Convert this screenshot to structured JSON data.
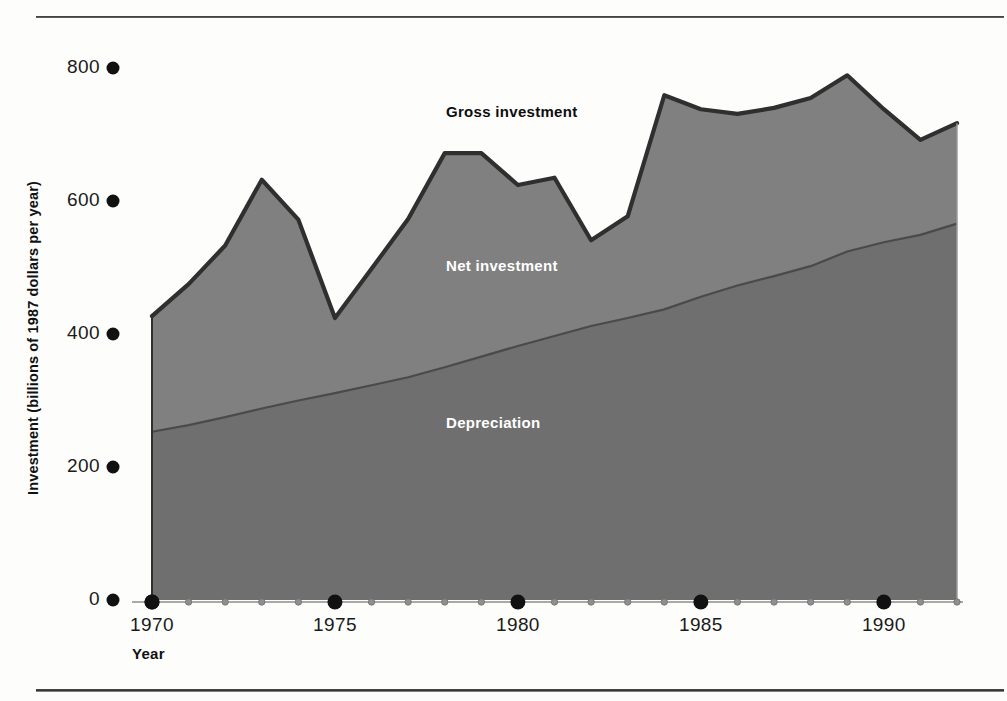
{
  "figure": {
    "y_axis_title": "Investment (billions of 1987 dollars per year)",
    "x_axis_title": "Year",
    "label_gross": "Gross investment",
    "label_net": "Net investment",
    "label_depreciation": "Depreciation",
    "colors": {
      "gross_area": "#808080",
      "depreciation_area": "#6f6f6f",
      "gross_line": "#2f2f2f",
      "depreciation_line": "#4a4a4a",
      "tick_dot": "#111111",
      "background": "#fdfdfc",
      "text": "#111111",
      "label_on_fill": "#ffffff"
    }
  },
  "chart_data": {
    "type": "area",
    "title": "",
    "subtitle": "",
    "xlabel": "Year",
    "ylabel": "Investment (billions of 1987 dollars per year)",
    "xlim": [
      1969,
      1992.2
    ],
    "ylim": [
      0,
      830
    ],
    "yticks": [
      0,
      200,
      400,
      600,
      800
    ],
    "ytick_labels": [
      "0",
      "200",
      "400",
      "600",
      "800"
    ],
    "xticks_major": [
      1970,
      1975,
      1980,
      1985,
      1990
    ],
    "xtick_labels": [
      "1970",
      "1975",
      "1980",
      "1985",
      "1990"
    ],
    "xticks_minor": [
      1971,
      1972,
      1973,
      1974,
      1976,
      1977,
      1978,
      1979,
      1981,
      1982,
      1983,
      1984,
      1986,
      1987,
      1988,
      1989,
      1991,
      1992
    ],
    "grid": false,
    "legend_position": "inline-annotation",
    "stacking": "Gross investment = Depreciation + Net investment",
    "x": [
      1970,
      1971,
      1972,
      1973,
      1974,
      1975,
      1976,
      1977,
      1978,
      1979,
      1980,
      1981,
      1982,
      1983,
      1984,
      1985,
      1986,
      1987,
      1988,
      1989,
      1990,
      1991,
      1992
    ],
    "series": [
      {
        "name": "Gross investment",
        "values": [
          427,
          475,
          533,
          632,
          572,
          424,
          498,
          573,
          672,
          672,
          624,
          635,
          541,
          577,
          759,
          738,
          731,
          740,
          755,
          789,
          738,
          692,
          717
        ]
      },
      {
        "name": "Depreciation",
        "values": [
          253,
          263,
          275,
          288,
          300,
          311,
          323,
          335,
          350,
          366,
          382,
          397,
          412,
          424,
          437,
          456,
          473,
          487,
          502,
          524,
          538,
          549,
          566
        ]
      },
      {
        "name": "Net investment",
        "values": [
          174,
          212,
          258,
          344,
          272,
          113,
          175,
          238,
          322,
          306,
          242,
          238,
          129,
          153,
          322,
          282,
          258,
          253,
          253,
          265,
          200,
          143,
          151
        ]
      }
    ],
    "annotations": [
      {
        "text": "Gross investment",
        "x": 1978,
        "y": 790,
        "color": "#0d0d0d"
      },
      {
        "text": "Net investment",
        "x": 1978,
        "y": 560,
        "color": "#ffffff"
      },
      {
        "text": "Depreciation",
        "x": 1978,
        "y": 320,
        "color": "#ffffff"
      }
    ]
  }
}
